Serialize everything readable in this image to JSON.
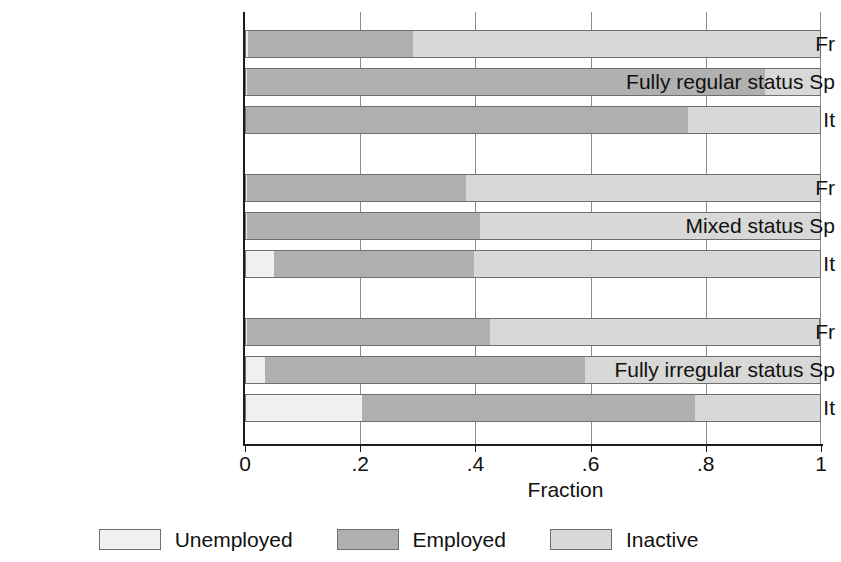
{
  "chart_data": {
    "type": "bar",
    "orientation": "horizontal",
    "stacked": true,
    "normalized": true,
    "title": "",
    "xlabel": "Fraction",
    "ylabel": "",
    "xlim": [
      0,
      1
    ],
    "xticks": [
      0,
      0.2,
      0.4,
      0.6,
      0.8,
      1
    ],
    "xticklabels": [
      "0",
      ".2",
      ".4",
      ".6",
      ".8",
      "1"
    ],
    "grid": "vertical",
    "legend_position": "bottom",
    "legend": [
      "Unemployed",
      "Employed",
      "Inactive"
    ],
    "series": [
      {
        "name": "Unemployed",
        "color": "#f0f0ee",
        "values": [
          0.005,
          0.004,
          0.0,
          0.003,
          0.003,
          0.051,
          0.004,
          0.035,
          0.203
        ]
      },
      {
        "name": "Employed",
        "color": "#b0b0b0",
        "values": [
          0.287,
          0.899,
          0.769,
          0.381,
          0.405,
          0.346,
          0.422,
          0.555,
          0.578
        ]
      },
      {
        "name": "Inactive",
        "color": "#d8d8d6",
        "values": [
          0.708,
          0.097,
          0.231,
          0.616,
          0.592,
          0.603,
          0.574,
          0.41,
          0.219
        ]
      }
    ],
    "groups": [
      {
        "label": "Fully regular status",
        "categories": [
          "Fr",
          "Sp",
          "It"
        ],
        "rows": [
          {
            "country": "Fr",
            "unemployed": 0.005,
            "employed": 0.287,
            "inactive": 0.708
          },
          {
            "country": "Sp",
            "unemployed": 0.004,
            "employed": 0.899,
            "inactive": 0.097
          },
          {
            "country": "It",
            "unemployed": 0.0,
            "employed": 0.769,
            "inactive": 0.231
          }
        ]
      },
      {
        "label": "Mixed status",
        "categories": [
          "Fr",
          "Sp",
          "It"
        ],
        "rows": [
          {
            "country": "Fr",
            "unemployed": 0.003,
            "employed": 0.381,
            "inactive": 0.616
          },
          {
            "country": "Sp",
            "unemployed": 0.003,
            "employed": 0.405,
            "inactive": 0.592
          },
          {
            "country": "It",
            "unemployed": 0.051,
            "employed": 0.346,
            "inactive": 0.603
          }
        ]
      },
      {
        "label": "Fully irregular status",
        "categories": [
          "Fr",
          "Sp",
          "It"
        ],
        "rows": [
          {
            "country": "Fr",
            "unemployed": 0.003,
            "employed": 0.422,
            "inactive": 0.574
          },
          {
            "country": "Sp",
            "unemployed": 0.035,
            "employed": 0.555,
            "inactive": 0.41
          },
          {
            "country": "It",
            "unemployed": 0.203,
            "employed": 0.578,
            "inactive": 0.219
          }
        ]
      }
    ]
  },
  "labels": {
    "rows": [
      "Fr",
      "Fully regular status Sp",
      "It",
      "Fr",
      "Mixed status Sp",
      "It",
      "Fr",
      "Fully irregular status Sp",
      "It"
    ]
  },
  "axis": {
    "x_title": "Fraction",
    "ticks": [
      "0",
      ".2",
      ".4",
      ".6",
      ".8",
      "1"
    ]
  },
  "legend": {
    "items": [
      {
        "label": "Unemployed",
        "color": "#f0f0ee"
      },
      {
        "label": "Employed",
        "color": "#b0b0b0"
      },
      {
        "label": "Inactive",
        "color": "#d8d8d6"
      }
    ]
  }
}
